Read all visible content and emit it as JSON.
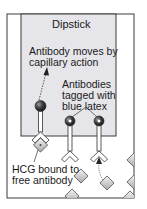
{
  "diagram": {
    "dipstick_label": "Dipstick",
    "labels": {
      "capillary_line1": "Antibody moves by",
      "capillary_line2": "capillary action",
      "tagged_line1": "Antibodies",
      "tagged_line2": "tagged with",
      "tagged_line3": "blue latex",
      "hcg_line1": "HCG bound to",
      "hcg_line2": "free antibody"
    },
    "colors": {
      "frame": "#3a3a3a",
      "dipstick_fill": "#e6e6ea",
      "latex_bead": "#3c3c3c",
      "hcg": "#c8c8c8"
    }
  }
}
